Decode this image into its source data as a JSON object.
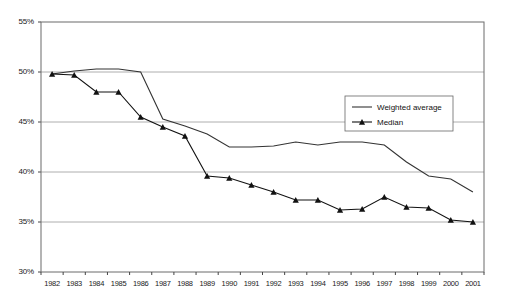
{
  "chart_data": {
    "type": "line",
    "title": "",
    "subtitle": "",
    "xlabel": "",
    "ylabel": "",
    "categories": [
      "1982",
      "1983",
      "1984",
      "1985",
      "1986",
      "1987",
      "1988",
      "1989",
      "1990",
      "1991",
      "1992",
      "1993",
      "1994",
      "1995",
      "1996",
      "1997",
      "1998",
      "1999",
      "2000",
      "2001"
    ],
    "ylim": [
      30,
      55
    ],
    "ytick_labels": [
      "30%",
      "35%",
      "40%",
      "45%",
      "50%",
      "55%"
    ],
    "ytick_values": [
      30,
      35,
      40,
      45,
      50,
      55
    ],
    "grid": "horizontal",
    "legend_position": "upper-right-inside",
    "series": [
      {
        "name": "Weighted average",
        "marker": "none",
        "color": "#333333",
        "values": [
          49.8,
          50.1,
          50.3,
          50.3,
          50.0,
          45.3,
          44.6,
          43.8,
          42.5,
          42.5,
          42.6,
          43.0,
          42.7,
          43.0,
          43.0,
          42.7,
          41.0,
          39.6,
          39.3,
          38.0
        ]
      },
      {
        "name": "Median",
        "marker": "triangle",
        "color": "#111111",
        "values": [
          49.8,
          49.7,
          48.0,
          48.0,
          45.5,
          44.5,
          43.6,
          39.6,
          39.4,
          38.7,
          38.0,
          37.2,
          37.2,
          36.2,
          36.3,
          37.5,
          36.5,
          36.4,
          35.2,
          35.0
        ]
      }
    ]
  },
  "legend": {
    "items": [
      {
        "label": "Weighted average"
      },
      {
        "label": "Median"
      }
    ]
  }
}
